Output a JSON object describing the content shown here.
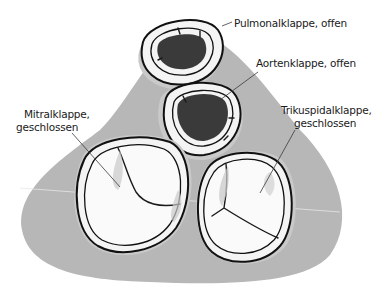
{
  "diagram": {
    "type": "anatomical-illustration",
    "colors": {
      "background": "#ffffff",
      "tissue": "#b5b5b5",
      "valve_ring": "#f4f4f4",
      "open_lumen": "#3a3a3a",
      "outline": "#111111"
    },
    "labels": [
      {
        "id": "pulmonal",
        "lines": [
          "Pulmonalklappe, offen"
        ]
      },
      {
        "id": "aorten",
        "lines": [
          "Aortenklappe, offen"
        ]
      },
      {
        "id": "mitral",
        "lines": [
          "Mitralklappe,",
          "geschlossen"
        ]
      },
      {
        "id": "trikuspidal",
        "lines": [
          "Trikuspidalklappe,",
          "geschlossen"
        ]
      }
    ],
    "valves": [
      {
        "name": "Pulmonalklappe",
        "state": "offen"
      },
      {
        "name": "Aortenklappe",
        "state": "offen"
      },
      {
        "name": "Mitralklappe",
        "state": "geschlossen"
      },
      {
        "name": "Trikuspidalklappe",
        "state": "geschlossen"
      }
    ]
  }
}
